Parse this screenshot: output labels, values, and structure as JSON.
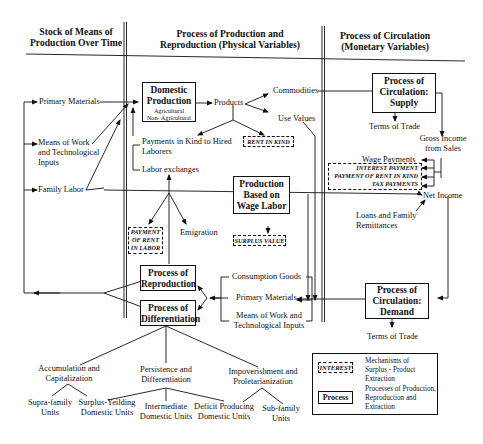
{
  "headers": {
    "stock": [
      "Stock of Means of",
      "Production Over Time"
    ],
    "production": [
      "Process of Production and",
      "Reproduction (Physical Variables)"
    ],
    "circulation": [
      "Process of  Circulation",
      "(Monetary Variables)"
    ]
  },
  "stock_items": {
    "primary_materials": "Primary Materials",
    "means_of_work": [
      "Means of Work",
      "and Technological",
      "Inputs"
    ],
    "family_labor": "Family Labor"
  },
  "boxes": {
    "domestic_production": {
      "title": [
        "Domestic",
        "Production"
      ],
      "sub": [
        "Agricultural",
        "Non- Agricultural"
      ]
    },
    "wage_labor": [
      "Production",
      "Based on",
      "Wage Labor"
    ],
    "reproduction": [
      "Process of",
      "Reproduction"
    ],
    "differentiation": [
      "Process of",
      "Differentiation"
    ],
    "supply": [
      "Process of",
      "Circulation:",
      "Supply"
    ],
    "demand": [
      "Process of",
      "Circulation:",
      "Demand"
    ]
  },
  "mechanisms": {
    "rent_in_kind": "RENT IN KIND",
    "rent_in_labor": [
      "PAYMENT",
      "OF RENT",
      "IN LABOR"
    ],
    "surplus_value": "SURPLUS VALUE",
    "interest_payment": "INTEREST PAYMENT",
    "payment_rent_kind": "PAYMENT OF RENT IN KIND",
    "tax_payments": "TAX  PAYMENTS"
  },
  "labels": {
    "products": "Products",
    "commodities": "Commodities",
    "use_values": "Use Values",
    "payments_in_kind": [
      "Payments in Kind to Hired",
      "Laborers"
    ],
    "labor_exchanges": "Labor exchanges",
    "emigration": "Emigration",
    "terms_of_trade_top": "Terms of Trade",
    "gross_income": [
      "Gross Income",
      "from Sales"
    ],
    "wage_payments": "Wage Payments",
    "net_income": "Net Income",
    "loans": [
      "Loans and Family",
      "Remittances"
    ],
    "consumption_goods": "Consumption Goods",
    "primary_materials_2": "Primary Materials",
    "means_of_work_2": [
      "Means of Work and",
      "Technological Inputs"
    ],
    "terms_of_trade_bottom": "Terms of Trade"
  },
  "outcomes": {
    "accumulation": [
      "Accumulation and",
      "Capitalization"
    ],
    "persistence": [
      "Persistence and",
      "Differentiation"
    ],
    "impoverishment": [
      "Impoverishment and",
      "Proletarianization"
    ],
    "supra_family": [
      "Supra-family",
      "Units"
    ],
    "surplus_yielding": [
      "Surplus-Yeilding",
      "Domestic Units"
    ],
    "intermediate": [
      "Intermediate",
      "Domestic Units"
    ],
    "deficit": [
      "Deficit Producing",
      "Domestic Units"
    ],
    "sub_family": [
      "Sub-family",
      "Units"
    ]
  },
  "legend": {
    "mechanism_sample": "INTEREST",
    "mechanism_desc": [
      "Mechanisms of",
      "Surplus - Product",
      "Extraction"
    ],
    "process_sample": "Process",
    "process_desc": [
      "Processes of Production,",
      "Reproduction and",
      "Extraction"
    ]
  }
}
